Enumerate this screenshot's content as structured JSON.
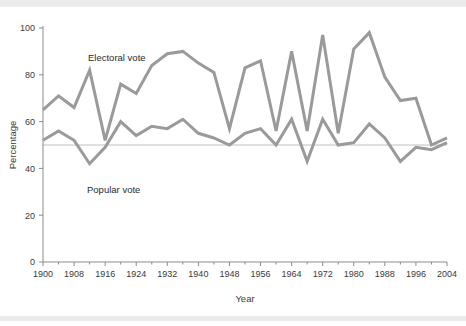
{
  "chart_data": {
    "type": "line",
    "title": "",
    "xlabel": "Year",
    "ylabel": "Percentage",
    "xlim": [
      1900,
      2004
    ],
    "ylim": [
      0,
      100
    ],
    "grid": false,
    "legend_position": "inline-annotations",
    "reference_line": {
      "value": 50,
      "label": ""
    },
    "x_tick_labels": [
      "1900",
      "1908",
      "1916",
      "1924",
      "1932",
      "1940",
      "1948",
      "1956",
      "1964",
      "1972",
      "1980",
      "1988",
      "1996",
      "2004"
    ],
    "x_tick_values": [
      1900,
      1908,
      1916,
      1924,
      1932,
      1940,
      1948,
      1956,
      1964,
      1972,
      1980,
      1988,
      1996,
      2004
    ],
    "x_minor_tick_values": [
      1904,
      1912,
      1920,
      1928,
      1936,
      1944,
      1952,
      1960,
      1968,
      1976,
      1984,
      1992,
      2000
    ],
    "y_tick_labels": [
      "0",
      "20",
      "40",
      "60",
      "80",
      "100"
    ],
    "y_tick_values": [
      0,
      20,
      40,
      60,
      80,
      100
    ],
    "x": [
      1900,
      1904,
      1908,
      1912,
      1916,
      1920,
      1924,
      1928,
      1932,
      1936,
      1940,
      1944,
      1948,
      1952,
      1956,
      1960,
      1964,
      1968,
      1972,
      1976,
      1980,
      1984,
      1988,
      1992,
      1996,
      2000,
      2004
    ],
    "series": [
      {
        "name": "Electoral vote",
        "color": "#9a9a9a",
        "values": [
          65,
          71,
          66,
          82,
          52,
          76,
          72,
          84,
          89,
          90,
          85,
          81,
          57,
          83,
          86,
          56,
          90,
          56,
          97,
          55,
          91,
          98,
          79,
          69,
          70,
          50,
          53
        ]
      },
      {
        "name": "Popular vote",
        "color": "#9a9a9a",
        "values": [
          52,
          56,
          52,
          42,
          49,
          60,
          54,
          58,
          57,
          61,
          55,
          53,
          50,
          55,
          57,
          50,
          61,
          43,
          61,
          50,
          51,
          59,
          53,
          43,
          49,
          48,
          51
        ]
      }
    ],
    "annotations": [
      {
        "text": "Electoral vote",
        "x_px": 88,
        "y_px": 53
      },
      {
        "text": "Popular vote",
        "x_px": 87,
        "y_px": 185
      }
    ]
  },
  "axes": {
    "y_title": "Percentage",
    "x_title": "Year"
  }
}
